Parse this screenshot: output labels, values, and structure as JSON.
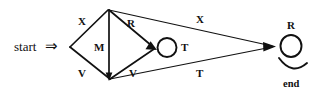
{
  "diagram": {
    "type": "state-transition-graph",
    "background_color": "#ffffff",
    "ink_color": "#111111",
    "start": {
      "label": "start",
      "arrow_glyph": "⇒"
    },
    "end": {
      "label": "end"
    },
    "edge_labels": {
      "top_left": "X",
      "diagonal_right": "R",
      "top_right": "X",
      "vertical_middle": "M",
      "bottom_left": "V",
      "bottom_middle": "V",
      "bottom_right": "T",
      "middle_loop": "T",
      "end_loop": "R"
    },
    "nodes": [
      {
        "id": "left",
        "name": "left-vertex"
      },
      {
        "id": "top",
        "name": "top-vertex"
      },
      {
        "id": "bottom",
        "name": "bottom-vertex"
      },
      {
        "id": "middle",
        "name": "middle-loop-node"
      },
      {
        "id": "right",
        "name": "right-end-node"
      }
    ]
  }
}
